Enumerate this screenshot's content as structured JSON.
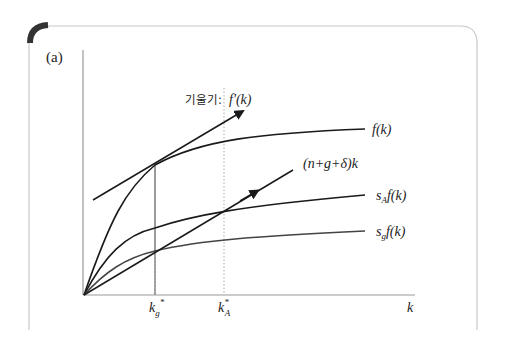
{
  "panel_label": "(a)",
  "slope_label": {
    "prefix": "기울기:",
    "expr": "f′(k)"
  },
  "curve_labels": {
    "production": "f(k)",
    "break_even": "(n+g+δ)k",
    "savings_A": "s",
    "savings_A_sub": "A",
    "savings_A_tail": "f(k)",
    "savings_g": "s",
    "savings_g_sub": "g",
    "savings_g_tail": "f(k)"
  },
  "axis": {
    "x_label": "k",
    "ticks": [
      {
        "base": "k",
        "sup": "*",
        "sub": "g"
      },
      {
        "base": "k",
        "sup": "*",
        "sub": "A"
      }
    ]
  },
  "colors": {
    "curve": "#1a1a1a",
    "curve_light": "#444444",
    "axis": "#999999",
    "frame": "#c8c8c8",
    "corner_accent": "#333333",
    "guide": "#aaaaaa"
  }
}
